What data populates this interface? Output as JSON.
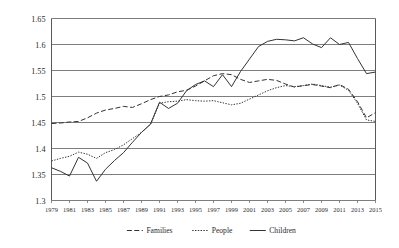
{
  "chart_data": {
    "type": "line",
    "title": "",
    "xlabel": "",
    "ylabel": "",
    "ylim": [
      1.3,
      1.65
    ],
    "xlim": [
      1979,
      2015
    ],
    "grid": true,
    "legend_position": "bottom",
    "ytick_labels": [
      "1.65",
      "1.6",
      "1.55",
      "1.5",
      "1.45",
      "1.4",
      "1.35",
      "1.3"
    ],
    "ytick_values": [
      1.65,
      1.6,
      1.55,
      1.5,
      1.45,
      1.4,
      1.35,
      1.3
    ],
    "xtick_labels": [
      "1979",
      "1981",
      "1983",
      "1985",
      "1987",
      "1989",
      "1991",
      "1993",
      "1995",
      "1997",
      "1999",
      "2001",
      "2003",
      "2005",
      "2007",
      "2009",
      "2011",
      "2013",
      "2015"
    ],
    "xtick_values": [
      1979,
      1981,
      1983,
      1985,
      1987,
      1989,
      1991,
      1993,
      1995,
      1997,
      1999,
      2001,
      2003,
      2005,
      2007,
      2009,
      2011,
      2013,
      2015
    ],
    "x": [
      1979,
      1980,
      1981,
      1982,
      1983,
      1984,
      1985,
      1986,
      1987,
      1988,
      1989,
      1990,
      1991,
      1992,
      1993,
      1994,
      1995,
      1996,
      1997,
      1998,
      1999,
      2000,
      2001,
      2002,
      2003,
      2004,
      2005,
      2006,
      2007,
      2008,
      2009,
      2010,
      2011,
      2012,
      2013,
      2014,
      2015
    ],
    "series": [
      {
        "name": "Families",
        "style": "dashed",
        "color": "#333333",
        "values": [
          1.448,
          1.449,
          1.451,
          1.452,
          1.459,
          1.468,
          1.474,
          1.477,
          1.481,
          1.479,
          1.486,
          1.494,
          1.5,
          1.503,
          1.509,
          1.512,
          1.52,
          1.53,
          1.54,
          1.544,
          1.542,
          1.533,
          1.527,
          1.53,
          1.533,
          1.531,
          1.524,
          1.518,
          1.521,
          1.523,
          1.52,
          1.517,
          1.523,
          1.514,
          1.49,
          1.459,
          1.469
        ]
      },
      {
        "name": "People",
        "style": "dotted",
        "color": "#333333",
        "values": [
          1.376,
          1.381,
          1.385,
          1.393,
          1.389,
          1.381,
          1.392,
          1.398,
          1.407,
          1.419,
          1.431,
          1.446,
          1.487,
          1.49,
          1.491,
          1.494,
          1.492,
          1.491,
          1.492,
          1.488,
          1.484,
          1.487,
          1.495,
          1.503,
          1.511,
          1.517,
          1.521,
          1.519,
          1.521,
          1.524,
          1.521,
          1.518,
          1.522,
          1.512,
          1.487,
          1.455,
          1.452
        ]
      },
      {
        "name": "Children",
        "style": "solid",
        "color": "#333333",
        "values": [
          1.363,
          1.356,
          1.347,
          1.383,
          1.372,
          1.337,
          1.36,
          1.377,
          1.392,
          1.412,
          1.431,
          1.447,
          1.489,
          1.477,
          1.487,
          1.511,
          1.523,
          1.53,
          1.519,
          1.542,
          1.519,
          1.548,
          1.572,
          1.596,
          1.606,
          1.61,
          1.609,
          1.607,
          1.613,
          1.601,
          1.594,
          1.613,
          1.6,
          1.604,
          1.573,
          1.544,
          1.547
        ]
      }
    ]
  },
  "legend": {
    "items": [
      {
        "label": "Families"
      },
      {
        "label": "People"
      },
      {
        "label": "Children"
      }
    ]
  }
}
